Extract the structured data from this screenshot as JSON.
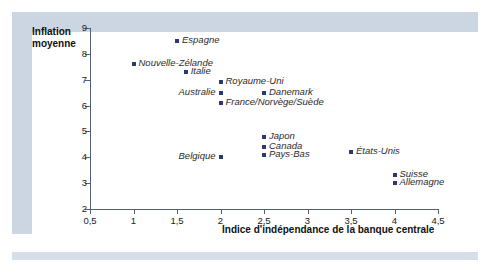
{
  "chart_data": {
    "type": "scatter",
    "title": "",
    "xlabel": "Indice d'indépendance de la banque centrale",
    "ylabel": "Inflation moyenne",
    "xlim": [
      0.5,
      4.5
    ],
    "ylim": [
      2,
      9
    ],
    "grid": false,
    "legend": "none",
    "xticks": [
      "0,5",
      "1",
      "1,5",
      "2",
      "2,5",
      "3",
      "3,5",
      "4",
      "4,5"
    ],
    "xtick_values": [
      0.5,
      1,
      1.5,
      2,
      2.5,
      3,
      3.5,
      4,
      4.5
    ],
    "yticks": [
      "2",
      "3",
      "4",
      "5",
      "6",
      "7",
      "8",
      "9"
    ],
    "ytick_values": [
      2,
      3,
      4,
      5,
      6,
      7,
      8,
      9
    ],
    "marker_color": "#2b3a6b",
    "points": [
      {
        "label": "Espagne",
        "x": 1.5,
        "y": 8.5,
        "label_side": "right"
      },
      {
        "label": "Nouvelle-Zélande",
        "x": 1.0,
        "y": 7.6,
        "label_side": "right"
      },
      {
        "label": "Italie",
        "x": 1.6,
        "y": 7.3,
        "label_side": "right"
      },
      {
        "label": "Royaume-Uni",
        "x": 2.0,
        "y": 6.9,
        "label_side": "right"
      },
      {
        "label": "Australie",
        "x": 2.0,
        "y": 6.5,
        "label_side": "left"
      },
      {
        "label": "Danemark",
        "x": 2.5,
        "y": 6.5,
        "label_side": "right"
      },
      {
        "label": "France/Norvège/Suède",
        "x": 2.0,
        "y": 6.1,
        "label_side": "right"
      },
      {
        "label": "Japon",
        "x": 2.5,
        "y": 4.8,
        "label_side": "right"
      },
      {
        "label": "Canada",
        "x": 2.5,
        "y": 4.4,
        "label_side": "right"
      },
      {
        "label": "Pays-Bas",
        "x": 2.5,
        "y": 4.1,
        "label_side": "right"
      },
      {
        "label": "Belgique",
        "x": 2.0,
        "y": 4.0,
        "label_side": "left"
      },
      {
        "label": "États-Unis",
        "x": 3.5,
        "y": 4.2,
        "label_side": "right"
      },
      {
        "label": "Suisse",
        "x": 4.0,
        "y": 3.3,
        "label_side": "right"
      },
      {
        "label": "Allemagne",
        "x": 4.0,
        "y": 3.0,
        "label_side": "right"
      }
    ]
  },
  "axis_titles": {
    "y_line1": "Inflation",
    "y_line2": "moyenne",
    "x": "Indice d'indépendance de la banque centrale"
  }
}
